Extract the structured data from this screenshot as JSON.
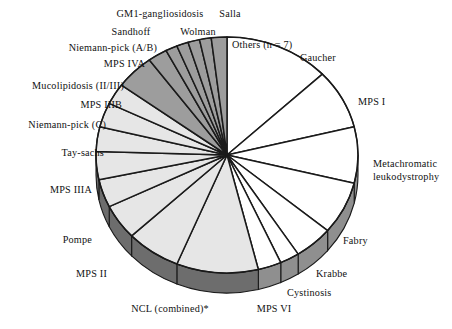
{
  "figure": {
    "title": "",
    "footnote_marker": "*"
  },
  "chart_data": {
    "type": "pie",
    "title": "",
    "xlabel": "",
    "ylabel": "",
    "legend_position": "outside-callout-labels",
    "grid": false,
    "start_angle_deg": 0,
    "direction": "clockwise",
    "units": "percent of cases",
    "labels": [
      "Gaucher",
      "MPS I",
      "Metachromatic leukodystrophy",
      "Fabry",
      "Krabbe",
      "Cystinosis",
      "MPS VI",
      "NCL (combined)*",
      "MPS II",
      "Pompe",
      "MPS IIIA",
      "Tay-sachs",
      "Niemann-pick (C)",
      "MPS IIIB",
      "Mucolipidosis (II/III)",
      "MPS IVA",
      "Niemann-pick (A/B)",
      "Sandhoff",
      "GM1-gangliosidosis",
      "Wolman",
      "Salla",
      "Others (n = 7)"
    ],
    "values": [
      13.5,
      8.5,
      8.0,
      7.5,
      5.0,
      2.5,
      3.0,
      10.5,
      7.0,
      5.0,
      4.0,
      4.0,
      3.5,
      3.5,
      3.0,
      5.0,
      2.5,
      1.5,
      1.5,
      1.5,
      1.5,
      2.0
    ],
    "slice_shades": [
      "white",
      "white",
      "white",
      "white",
      "white",
      "white",
      "white",
      "light",
      "light",
      "light",
      "light",
      "light",
      "light",
      "light",
      "light",
      "dark",
      "dark",
      "dark",
      "dark",
      "dark",
      "dark",
      "dark"
    ]
  },
  "colors": {
    "slice_white": "#ffffff",
    "slice_light": "#e6e6e6",
    "slice_dark": "#9d9d9d",
    "rim_dark": "#6d6d6d",
    "rim_light": "#8f8f8f",
    "outline": "#1a1a1a",
    "background": "#ffffff",
    "text": "#111111"
  },
  "labels": {
    "gaucher": "Gaucher",
    "mps_i": "MPS I",
    "metachromatic_line1": "Metachromatic",
    "metachromatic_line2": "leukodystrophy",
    "fabry": "Fabry",
    "krabbe": "Krabbe",
    "cystinosis": "Cystinosis",
    "mps_vi": "MPS VI",
    "ncl_combined": "NCL (combined)*",
    "mps_ii": "MPS II",
    "pompe": "Pompe",
    "mps_iiia": "MPS IIIA",
    "tay_sachs": "Tay-sachs",
    "niemann_pick_c": "Niemann-pick (C)",
    "mps_iiib": "MPS IIIB",
    "mucolipidosis": "Mucolipidosis (II/III)",
    "mps_iva": "MPS IVA",
    "niemann_pick_ab": "Niemann-pick (A/B)",
    "sandhoff": "Sandhoff",
    "gm1_gangliosidosis": "GM1-gangliosidosis",
    "wolman": "Wolman",
    "salla": "Salla",
    "others": "Others (n = 7)"
  }
}
